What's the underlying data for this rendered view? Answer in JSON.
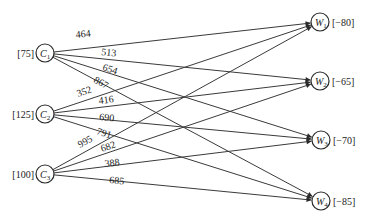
{
  "diagram": {
    "type": "bipartite-transportation-network",
    "sources": [
      {
        "id": "C1",
        "letter": "C",
        "index": "1",
        "supply": "[75]",
        "x": 45,
        "y": 53
      },
      {
        "id": "C2",
        "letter": "C",
        "index": "2",
        "supply": "[125]",
        "x": 45,
        "y": 114
      },
      {
        "id": "C3",
        "letter": "C",
        "index": "3",
        "supply": "[100]",
        "x": 45,
        "y": 174
      }
    ],
    "sinks": [
      {
        "id": "W1",
        "letter": "W",
        "index": "1",
        "demand": "[−80]",
        "x": 320,
        "y": 22
      },
      {
        "id": "W2",
        "letter": "W",
        "index": "2",
        "demand": "[−65]",
        "x": 320,
        "y": 81
      },
      {
        "id": "W3",
        "letter": "W",
        "index": "3",
        "demand": "[−70]",
        "x": 321,
        "y": 140
      },
      {
        "id": "W4",
        "letter": "W",
        "index": "4",
        "demand": "[−85]",
        "x": 321,
        "y": 201
      }
    ],
    "edges": [
      {
        "from": "C1",
        "to": "W1",
        "cost": "464",
        "lx": 76,
        "ly": 38
      },
      {
        "from": "C1",
        "to": "W2",
        "cost": "513",
        "lx": 101,
        "ly": 55
      },
      {
        "from": "C1",
        "to": "W3",
        "cost": "654",
        "lx": 102,
        "ly": 70
      },
      {
        "from": "C1",
        "to": "W4",
        "cost": "867",
        "lx": 93,
        "ly": 82
      },
      {
        "from": "C2",
        "to": "W1",
        "cost": "352",
        "lx": 78,
        "ly": 97
      },
      {
        "from": "C2",
        "to": "W2",
        "cost": "416",
        "lx": 99,
        "ly": 104
      },
      {
        "from": "C2",
        "to": "W3",
        "cost": "690",
        "lx": 99,
        "ly": 120
      },
      {
        "from": "C2",
        "to": "W4",
        "cost": "791",
        "lx": 96,
        "ly": 134
      },
      {
        "from": "C3",
        "to": "W1",
        "cost": "995",
        "lx": 80,
        "ly": 148
      },
      {
        "from": "C3",
        "to": "W2",
        "cost": "682",
        "lx": 102,
        "ly": 152
      },
      {
        "from": "C3",
        "to": "W3",
        "cost": "388",
        "lx": 105,
        "ly": 167
      },
      {
        "from": "C3",
        "to": "W4",
        "cost": "685",
        "lx": 109,
        "ly": 183
      }
    ],
    "node_radius": 9
  }
}
